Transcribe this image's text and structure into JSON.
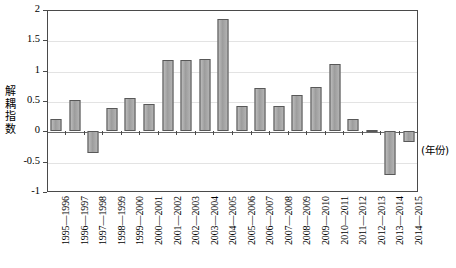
{
  "chart_data": {
    "type": "bar",
    "title": "",
    "subtitle": "",
    "xlabel": "(年份)",
    "ylabel": "解耦指数",
    "ylim": [
      -1,
      2
    ],
    "yticks": [
      2,
      1.5,
      1,
      0.5,
      0,
      -0.5,
      -1
    ],
    "ytick_labels": [
      "2",
      "1.5",
      "1",
      "0.5",
      "0",
      "-0.5",
      "-1"
    ],
    "grid": true,
    "legend": false,
    "legend_position": "none",
    "categories": [
      "1995—1996",
      "1996—1997",
      "1997—1998",
      "1998—1999",
      "1999—2000",
      "2000—2001",
      "2001—2002",
      "2002—2003",
      "2003—2004",
      "2004—2005",
      "2005—2006",
      "2006—2007",
      "2007—2008",
      "2008—2009",
      "2009—2010",
      "2010—2011",
      "2011—2012",
      "2012—2013",
      "2013—2014",
      "2014—2015"
    ],
    "values": [
      0.21,
      0.51,
      -0.35,
      0.38,
      0.55,
      0.45,
      1.18,
      1.18,
      1.2,
      1.85,
      0.42,
      0.72,
      0.42,
      0.6,
      0.73,
      1.11,
      0.2,
      0.02,
      -0.72,
      -0.17
    ],
    "series": [
      {
        "name": "解耦指数",
        "values": [
          0.21,
          0.51,
          -0.35,
          0.38,
          0.55,
          0.45,
          1.18,
          1.18,
          1.2,
          1.85,
          0.42,
          0.72,
          0.42,
          0.6,
          0.73,
          1.11,
          0.2,
          0.02,
          -0.72,
          -0.17
        ]
      }
    ]
  },
  "colors": {
    "bar_fill": "#a9a9a9",
    "bar_stroke": "#585858",
    "gridline": "#e3e3e3",
    "axis": "#4a4a4a",
    "text": "#000000"
  }
}
